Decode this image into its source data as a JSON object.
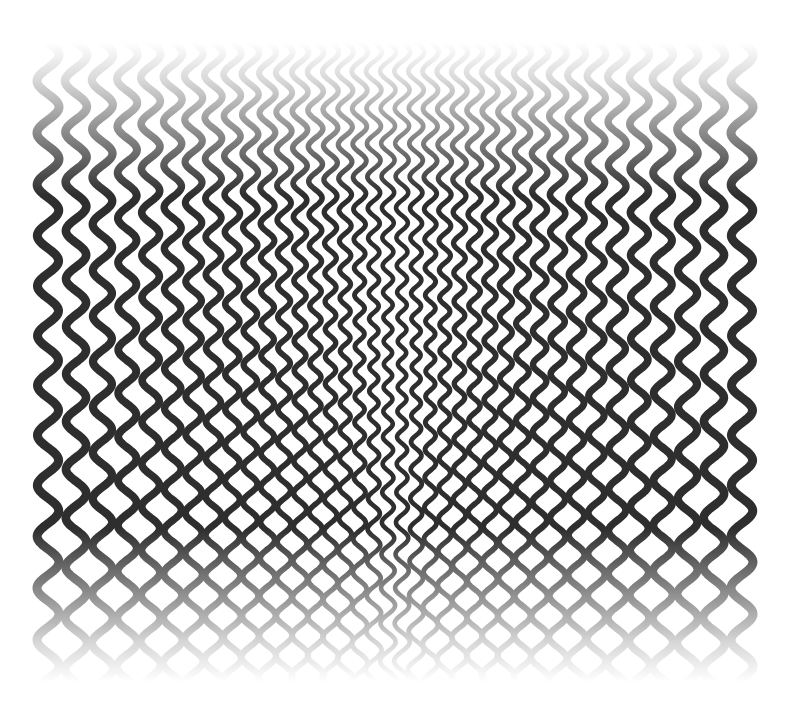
{
  "artwork": {
    "title": "",
    "description": "Op-art pattern of vertical wavy lines converging toward the center, fading at top and bottom",
    "background": "#ffffff",
    "line_color": "#2e2e2e",
    "fade_color": "#d8d8d8",
    "bounds": {
      "x0": 48,
      "x1": 742,
      "y0": 42,
      "y1": 682
    },
    "line_count": 38,
    "stroke_width_edge": 9,
    "stroke_width_center": 4.5,
    "wavelength_edge": 52,
    "wavelength_center": 22,
    "amplitude_edge": 11,
    "amplitude_center": 4,
    "fade_band": 150
  }
}
